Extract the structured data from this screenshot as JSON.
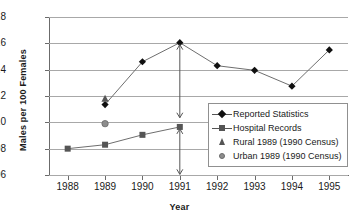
{
  "chart_data": {
    "type": "line",
    "title": "",
    "xlabel": "Year",
    "ylabel": "Males per 100 Females",
    "x": [
      1988,
      1989,
      1990,
      1991,
      1992,
      1993,
      1994,
      1995
    ],
    "xticklabels": [
      "1988",
      "1989",
      "1990",
      "1991",
      "1992",
      "1993",
      "1994",
      "1995"
    ],
    "xlim": [
      1987.5,
      1995.5
    ],
    "ylim": [
      106,
      118
    ],
    "yticks": [
      106,
      108,
      110,
      112,
      114,
      116,
      118
    ],
    "yticklabels": [
      "106",
      "108",
      "110",
      "112",
      "114",
      "116",
      "118"
    ],
    "grid": "horizontal",
    "legend_position": "center-right",
    "series": [
      {
        "name": "Reported Statistics",
        "marker": "diamond",
        "color": "#101010",
        "x": [
          1989,
          1990,
          1991,
          1992,
          1993,
          1994,
          1995
        ],
        "values": [
          111.35,
          114.6,
          116.05,
          114.3,
          113.95,
          112.75,
          115.5
        ]
      },
      {
        "name": "Hospital Records",
        "marker": "square",
        "color": "#555555",
        "x": [
          1988,
          1989,
          1990,
          1991
        ],
        "values": [
          108.0,
          108.3,
          109.05,
          109.65
        ]
      },
      {
        "name": "Rural 1989 (1990 Census)",
        "marker": "triangle",
        "color": "#555555",
        "x": [
          1989
        ],
        "values": [
          111.8
        ]
      },
      {
        "name": "Urban 1989 (1990 Census)",
        "marker": "circle",
        "color": "#8d8d8d",
        "x": [
          1989
        ],
        "values": [
          109.9
        ]
      }
    ],
    "annotations": [
      {
        "type": "double-arrow",
        "x": 1991,
        "y_top": 115.9,
        "y_bottom": 110.35
      },
      {
        "type": "double-arrow",
        "x": 1991,
        "y_top": 109.5,
        "y_bottom": 106.05
      }
    ]
  },
  "legend": {
    "items": [
      {
        "label": "Reported Statistics",
        "marker": "diamond"
      },
      {
        "label": "Hospital Records",
        "marker": "square"
      },
      {
        "label": "Rural 1989 (1990 Census)",
        "marker": "triangle"
      },
      {
        "label": "Urban 1989 (1990 Census)",
        "marker": "circle"
      }
    ]
  }
}
